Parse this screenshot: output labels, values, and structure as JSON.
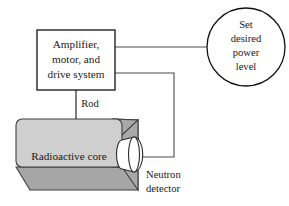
{
  "diagram": {
    "controller_box": {
      "lines": [
        "Amplifier,",
        "motor, and",
        "drive system"
      ]
    },
    "setpoint_circle": {
      "lines": [
        "Set",
        "desired",
        "power",
        "level"
      ]
    },
    "rod": {
      "label": "Rod"
    },
    "reactor": {
      "label": "Radioactive core"
    },
    "detector": {
      "lines": [
        "Neutron",
        "detector"
      ]
    },
    "colors": {
      "background": "#ffffff",
      "outline": "#111111",
      "connector": "#4a4a4a",
      "core_front": "#cfcfcf",
      "core_side": "#a9a9a9",
      "core_bottom": "#a6a6a6",
      "detector_fill": "#ffffff",
      "rod": "#6f6f6f",
      "text": "#1a1a1a"
    }
  }
}
